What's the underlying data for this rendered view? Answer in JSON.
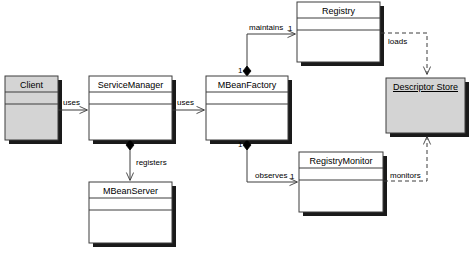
{
  "diagram": {
    "type": "uml-class-diagram",
    "classes": [
      {
        "id": "client",
        "name": "Client",
        "x": 5,
        "y": 76,
        "w": 53,
        "h": 64,
        "fill": "#d4d4d4",
        "compartments": 3,
        "style": "class"
      },
      {
        "id": "service-manager",
        "name": "ServiceManager",
        "x": 89,
        "y": 76,
        "w": 83,
        "h": 64,
        "fill": "#ffffff",
        "compartments": 3,
        "style": "class"
      },
      {
        "id": "mbean-factory",
        "name": "MBeanFactory",
        "x": 206,
        "y": 76,
        "w": 82,
        "h": 64,
        "fill": "#ffffff",
        "compartments": 3,
        "style": "class"
      },
      {
        "id": "registry",
        "name": "Registry",
        "x": 297,
        "y": 2,
        "w": 83,
        "h": 60,
        "fill": "#ffffff",
        "compartments": 3,
        "style": "class"
      },
      {
        "id": "descriptor-store",
        "name": "Descriptor Store",
        "x": 386,
        "y": 78,
        "w": 79,
        "h": 55,
        "fill": "#d4d4d4",
        "compartments": 1,
        "style": "object"
      },
      {
        "id": "mbean-server",
        "name": "MBeanServer",
        "x": 89,
        "y": 182,
        "w": 83,
        "h": 61,
        "fill": "#ffffff",
        "compartments": 3,
        "style": "class"
      },
      {
        "id": "registry-monitor",
        "name": "RegistryMonitor",
        "x": 299,
        "y": 152,
        "w": 84,
        "h": 60,
        "fill": "#ffffff",
        "compartments": 3,
        "style": "class"
      }
    ],
    "relationships": [
      {
        "id": "client-uses-servicemanager",
        "label": "uses",
        "from": "client",
        "to": "service-manager",
        "kind": "association",
        "arrow": "open",
        "multiplicity": ""
      },
      {
        "id": "servicemanager-uses-mbeanfactory",
        "label": "uses",
        "from": "service-manager",
        "to": "mbean-factory",
        "kind": "association",
        "arrow": "open",
        "multiplicity": ""
      },
      {
        "id": "servicemanager-registers-mbeanserver",
        "label": "registers",
        "from": "service-manager",
        "to": "mbean-server",
        "kind": "composition",
        "arrow": "open",
        "multiplicity": ""
      },
      {
        "id": "mbeanfactory-maintains-registry",
        "label": "maintains",
        "from": "mbean-factory",
        "to": "registry",
        "kind": "composition",
        "arrow": "open",
        "multiplicity": "1",
        "multiplicity_target": "1"
      },
      {
        "id": "mbeanfactory-observes-registrymonitor",
        "label": "observes",
        "from": "mbean-factory",
        "to": "registry-monitor",
        "kind": "composition",
        "arrow": "open",
        "multiplicity": "1",
        "multiplicity_target": "1"
      },
      {
        "id": "registry-loads-descriptorstore",
        "label": "loads",
        "from": "registry",
        "to": "descriptor-store",
        "kind": "dependency",
        "arrow": "open",
        "multiplicity": ""
      },
      {
        "id": "registrymonitor-monitors-descriptorstore",
        "label": "monitors",
        "from": "registry-monitor",
        "to": "descriptor-store",
        "kind": "dependency",
        "arrow": "open",
        "multiplicity": ""
      }
    ],
    "multiplicity_labels": [
      {
        "id": "mult-maintains-source",
        "value": "1",
        "x": 238,
        "y": 67
      },
      {
        "id": "mult-maintains-target",
        "value": "1",
        "x": 288,
        "y": 25
      },
      {
        "id": "mult-observes-source",
        "value": "1",
        "x": 238,
        "y": 141
      },
      {
        "id": "mult-observes-target",
        "value": "1",
        "x": 290,
        "y": 173
      }
    ],
    "edge_labels": [
      {
        "id": "label-uses-1",
        "value": "uses",
        "x": 63,
        "y": 99
      },
      {
        "id": "label-uses-2",
        "value": "uses",
        "x": 177,
        "y": 99
      },
      {
        "id": "label-registers",
        "value": "registers",
        "x": 136,
        "y": 159
      },
      {
        "id": "label-maintains",
        "value": "maintains",
        "x": 249,
        "y": 24
      },
      {
        "id": "label-observes",
        "value": "observes",
        "x": 255,
        "y": 172
      },
      {
        "id": "label-loads",
        "value": "loads",
        "x": 388,
        "y": 38
      },
      {
        "id": "label-monitors",
        "value": "monitors",
        "x": 390,
        "y": 172
      }
    ],
    "colors": {
      "shadow": "#1a1a1a",
      "stroke": "#3c3c3c",
      "fill_gray": "#d4d4d4",
      "fill_white": "#ffffff",
      "text": "#000000"
    }
  }
}
